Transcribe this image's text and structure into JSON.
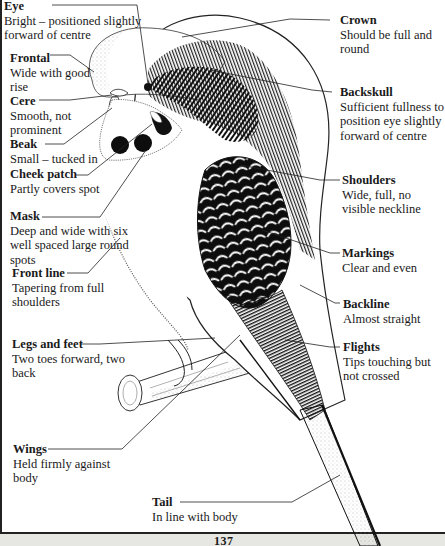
{
  "labels_left": [
    {
      "id": "eye",
      "title": "Eye",
      "desc": "Bright – positioned slightly forward of centre"
    },
    {
      "id": "frontal",
      "title": "Frontal",
      "desc": "Wide with good rise"
    },
    {
      "id": "cere",
      "title": "Cere",
      "desc": "Smooth, not prominent"
    },
    {
      "id": "beak",
      "title": "Beak",
      "desc": "Small – tucked in"
    },
    {
      "id": "cheek-patch",
      "title": "Cheek patch",
      "desc": "Partly covers spot"
    },
    {
      "id": "mask",
      "title": "Mask",
      "desc": "Deep and wide with six well spaced large round spots"
    },
    {
      "id": "front-line",
      "title": "Front line",
      "desc": "Tapering from full shoulders"
    },
    {
      "id": "legs-and-feet",
      "title": "Legs and feet",
      "desc": "Two toes forward, two back"
    },
    {
      "id": "wings",
      "title": "Wings",
      "desc": "Held firmly against body"
    },
    {
      "id": "tail",
      "title": "Tail",
      "desc": "In line with body"
    }
  ],
  "labels_right": [
    {
      "id": "crown",
      "title": "Crown",
      "desc": "Should be full and round"
    },
    {
      "id": "backskull",
      "title": "Backskull",
      "desc": "Sufficient fullness to position eye slightly forward of centre"
    },
    {
      "id": "shoulders",
      "title": "Shoulders",
      "desc": "Wide, full, no visible neckline"
    },
    {
      "id": "markings",
      "title": "Markings",
      "desc": "Clear and even"
    },
    {
      "id": "backline",
      "title": "Backline",
      "desc": "Almost straight"
    },
    {
      "id": "flights",
      "title": "Flights",
      "desc": "Tips touching but not crossed"
    }
  ],
  "page_number": "137"
}
